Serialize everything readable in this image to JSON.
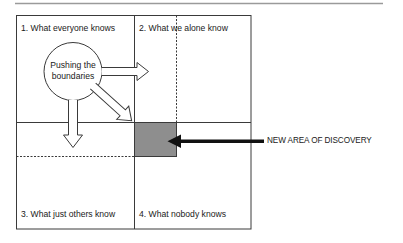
{
  "diagram": {
    "type": "quadrant-matrix",
    "quadrants": [
      {
        "id": 1,
        "label": "1. What everyone knows"
      },
      {
        "id": 2,
        "label": "2. What we alone know"
      },
      {
        "id": 3,
        "label": "3. What just others know"
      },
      {
        "id": 4,
        "label": "4. What nobody knows"
      }
    ],
    "center_node": {
      "line1": "Pushing the",
      "line2": "boundaries"
    },
    "callout": {
      "label": "NEW AREA OF DISCOVERY"
    },
    "colors": {
      "line": "#3a3a3a",
      "dashed_line": "#3a3a3a",
      "discovery_area_fill": "#8e8e8e",
      "callout_arrow": "#111111",
      "background": "#ffffff"
    }
  }
}
